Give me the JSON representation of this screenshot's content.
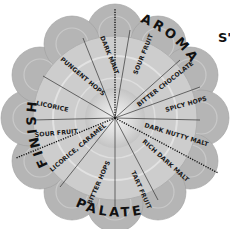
{
  "wheel": {
    "center": [
      115,
      118
    ],
    "categories": {
      "aroma": "AROMA",
      "finish": "FINISH",
      "palate": "PALATE"
    },
    "corner_text": "S'",
    "segments": [
      {
        "label": "DARK MALT",
        "group": "finish"
      },
      {
        "label": "SOUR FRUIT",
        "group": "aroma"
      },
      {
        "label": "BITTER CHOCOLATE",
        "group": "aroma"
      },
      {
        "label": "SPICY HOPS",
        "group": "aroma"
      },
      {
        "label": "DARK NUTTY MALT",
        "group": "aroma"
      },
      {
        "label": "RICH DARK MALT",
        "group": "palate"
      },
      {
        "label": "TART FRUIT",
        "group": "palate"
      },
      {
        "label": "BITTER HOPS",
        "group": "palate"
      },
      {
        "label": "LICORICE, CARAMEL",
        "group": "palate"
      },
      {
        "label": "SOUR FRUIT",
        "group": "finish"
      },
      {
        "label": "LICORICE",
        "group": "finish"
      },
      {
        "label": "PUNGENT HOPS",
        "group": "finish"
      }
    ],
    "colors": {
      "petal": "#b8b8b8",
      "inner": "#d6d6d6",
      "center": "#eeeeee",
      "divider": "#333333"
    }
  }
}
